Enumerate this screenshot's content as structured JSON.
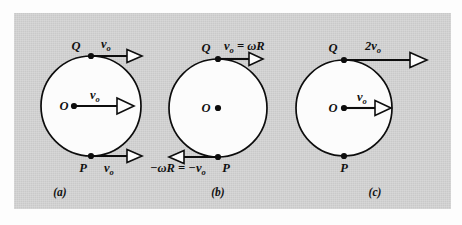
{
  "figure": {
    "background_color": "#c9c9c9",
    "page_color": "#fdfdfd",
    "ink_color": "#0d0d0d",
    "circle_fill": "#fcfcfc"
  },
  "panels": [
    {
      "caption": "(a)",
      "center_label": "O",
      "top_point_label": "Q",
      "bottom_point_label": "P",
      "top_vector_label": "v",
      "top_vector_sub": "o",
      "center_vector_label": "v",
      "center_vector_sub": "o",
      "bottom_vector_label": "v",
      "bottom_vector_sub": "o",
      "top_vector_direction": "right",
      "center_vector_direction": "right",
      "bottom_vector_direction": "right"
    },
    {
      "caption": "(b)",
      "center_label": "O",
      "top_point_label": "Q",
      "bottom_point_label": "P",
      "top_vector_label": "v",
      "top_vector_sub": "o",
      "top_vector_rest": " = ωR",
      "bottom_vector_label": "−ωR = −v",
      "bottom_vector_sub": "o",
      "top_vector_direction": "right",
      "center_vector_direction": "none",
      "bottom_vector_direction": "left"
    },
    {
      "caption": "(c)",
      "center_label": "O",
      "top_point_label": "Q",
      "bottom_point_label": "P",
      "top_vector_label": "2v",
      "top_vector_sub": "o",
      "center_vector_label": "v",
      "center_vector_sub": "o",
      "top_vector_direction": "right",
      "center_vector_direction": "right",
      "bottom_vector_direction": "none"
    }
  ]
}
